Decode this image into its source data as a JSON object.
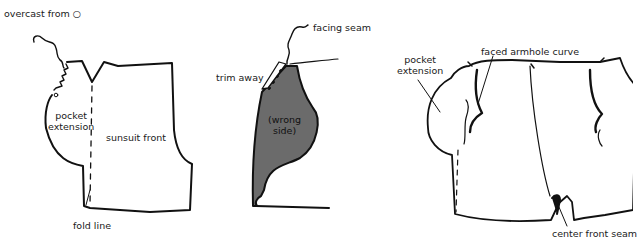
{
  "figures": [
    {
      "id": "sunsuit-front-flat",
      "labels": {
        "overcast": "overcast from ○",
        "pocket_extension": "pocket\nextension",
        "pocket_line1": "pocket",
        "pocket_line2": "extension",
        "sunsuit_front": "sunsuit front",
        "fold_line": "fold line"
      }
    },
    {
      "id": "folded-facing",
      "labels": {
        "facing_seam": "facing seam",
        "trim_away": "trim away",
        "wrong_line1": "(wrong",
        "wrong_line2": "side)"
      },
      "fill_color": "#6b6b6b"
    },
    {
      "id": "finished-front",
      "labels": {
        "pocket_line1": "pocket",
        "pocket_line2": "extension",
        "faced_armhole_curve": "faced armhole curve",
        "center_front_seam": "center front seam"
      }
    }
  ],
  "colors": {
    "ink": "#111111",
    "shade": "#6b6b6b",
    "background": "#ffffff"
  }
}
